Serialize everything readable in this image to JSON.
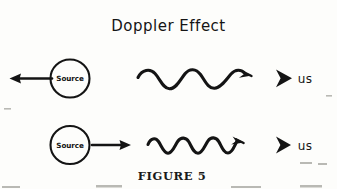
{
  "figure": {
    "title": "Doppler  Effect",
    "caption": "FIGURE 5",
    "background_color": "#fdfdfb",
    "ink_color": "#141414"
  },
  "rows": [
    {
      "name": "receding-source-row",
      "source_label": "Source",
      "motion_arrow": "left-arrow",
      "motion_direction": "left",
      "wave": {
        "name": "long-wavelength-wave",
        "cycles": 2.5,
        "description": "stretched wave",
        "arrow": "right-arrow"
      },
      "observer_icon": "observer-arrowhead-icon",
      "observer_label": "us"
    },
    {
      "name": "approaching-source-row",
      "source_label": "Source",
      "motion_arrow": "right-arrow",
      "motion_direction": "right",
      "wave": {
        "name": "short-wavelength-wave",
        "cycles": 4,
        "description": "compressed wave",
        "arrow": "right-arrow"
      },
      "observer_icon": "observer-arrowhead-icon",
      "observer_label": "us"
    }
  ]
}
